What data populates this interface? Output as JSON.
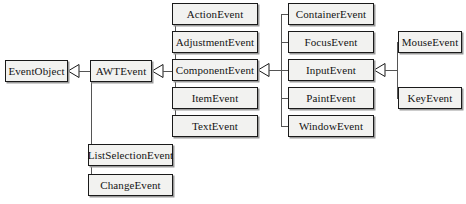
{
  "diagram": {
    "type": "uml-class-inheritance",
    "canvas": {
      "width": 466,
      "height": 204
    },
    "style": {
      "box_fill": "#f2f2f0",
      "box_border": "#1a1a1a",
      "box_shadow": "#9a9a9a",
      "line_color": "#555555",
      "text_color": "#141414",
      "background": "#ffffff",
      "arrow_type": "hollow-triangle-generalization",
      "arrow_direction": "points-left-toward-superclass"
    },
    "nodes": [
      {
        "id": "EventObject",
        "label": "EventObject",
        "x": 5,
        "y": 60,
        "w": 63,
        "h": 22,
        "column": 0
      },
      {
        "id": "AWTEvent",
        "label": "AWTEvent",
        "x": 90,
        "y": 60,
        "w": 62,
        "h": 22,
        "column": 1
      },
      {
        "id": "ListSelectionEvent",
        "label": "ListSelectionEvent",
        "x": 88,
        "y": 144,
        "w": 85,
        "h": 22,
        "column": 1
      },
      {
        "id": "ChangeEvent",
        "label": "ChangeEvent",
        "x": 88,
        "y": 174,
        "w": 85,
        "h": 22,
        "column": 1
      },
      {
        "id": "ActionEvent",
        "label": "ActionEvent",
        "x": 172,
        "y": 3,
        "w": 86,
        "h": 22,
        "column": 2
      },
      {
        "id": "AdjustmentEvent",
        "label": "AdjustmentEvent",
        "x": 172,
        "y": 31,
        "w": 86,
        "h": 22,
        "column": 2
      },
      {
        "id": "ComponentEvent",
        "label": "ComponentEvent",
        "x": 172,
        "y": 59,
        "w": 86,
        "h": 22,
        "column": 2
      },
      {
        "id": "ItemEvent",
        "label": "ItemEvent",
        "x": 172,
        "y": 87,
        "w": 86,
        "h": 22,
        "column": 2
      },
      {
        "id": "TextEvent",
        "label": "TextEvent",
        "x": 172,
        "y": 115,
        "w": 86,
        "h": 22,
        "column": 2
      },
      {
        "id": "ContainerEvent",
        "label": "ContainerEvent",
        "x": 288,
        "y": 3,
        "w": 86,
        "h": 22,
        "column": 3
      },
      {
        "id": "FocusEvent",
        "label": "FocusEvent",
        "x": 288,
        "y": 31,
        "w": 86,
        "h": 22,
        "column": 3
      },
      {
        "id": "InputEvent",
        "label": "InputEvent",
        "x": 288,
        "y": 59,
        "w": 86,
        "h": 22,
        "column": 3
      },
      {
        "id": "PaintEvent",
        "label": "PaintEvent",
        "x": 288,
        "y": 87,
        "w": 86,
        "h": 22,
        "column": 3
      },
      {
        "id": "WindowEvent",
        "label": "WindowEvent",
        "x": 288,
        "y": 115,
        "w": 86,
        "h": 22,
        "column": 3
      },
      {
        "id": "MouseEvent",
        "label": "MouseEvent",
        "x": 398,
        "y": 31,
        "w": 64,
        "h": 22,
        "column": 4
      },
      {
        "id": "KeyEvent",
        "label": "KeyEvent",
        "x": 398,
        "y": 87,
        "w": 64,
        "h": 22,
        "column": 4
      }
    ],
    "edges": [
      {
        "from": "AWTEvent",
        "to": "EventObject"
      },
      {
        "from": "ListSelectionEvent",
        "to": "EventObject"
      },
      {
        "from": "ChangeEvent",
        "to": "EventObject"
      },
      {
        "from": "ActionEvent",
        "to": "AWTEvent"
      },
      {
        "from": "AdjustmentEvent",
        "to": "AWTEvent"
      },
      {
        "from": "ComponentEvent",
        "to": "AWTEvent"
      },
      {
        "from": "ItemEvent",
        "to": "AWTEvent"
      },
      {
        "from": "TextEvent",
        "to": "AWTEvent"
      },
      {
        "from": "ContainerEvent",
        "to": "ComponentEvent"
      },
      {
        "from": "FocusEvent",
        "to": "ComponentEvent"
      },
      {
        "from": "InputEvent",
        "to": "ComponentEvent"
      },
      {
        "from": "PaintEvent",
        "to": "ComponentEvent"
      },
      {
        "from": "WindowEvent",
        "to": "ComponentEvent"
      },
      {
        "from": "MouseEvent",
        "to": "InputEvent"
      },
      {
        "from": "KeyEvent",
        "to": "InputEvent"
      }
    ]
  }
}
